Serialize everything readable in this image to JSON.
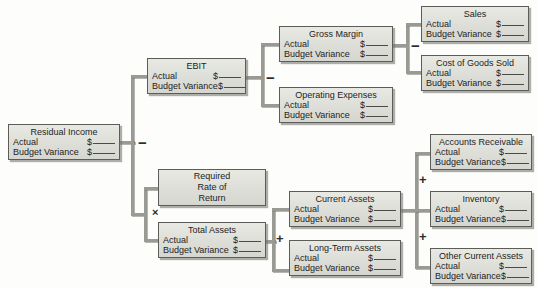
{
  "diagram": {
    "row_labels": {
      "actual": "Actual",
      "budget_variance": "Budget Variance",
      "currency": "$"
    },
    "operators": [
      {
        "name": "residual-income-minus",
        "symbol": "−"
      },
      {
        "name": "ebit-minus",
        "symbol": "−"
      },
      {
        "name": "gross-margin-minus",
        "symbol": "−"
      },
      {
        "name": "required-rate-times",
        "symbol": "×"
      },
      {
        "name": "total-assets-plus",
        "symbol": "+"
      },
      {
        "name": "current-assets-plus-top",
        "symbol": "+"
      },
      {
        "name": "current-assets-plus-bottom",
        "symbol": "+"
      }
    ],
    "nodes": {
      "residual_income": {
        "title": "Residual Income"
      },
      "ebit": {
        "title": "EBIT"
      },
      "gross_margin": {
        "title": "Gross Margin"
      },
      "operating_expenses": {
        "title": "Operating Expenses"
      },
      "sales": {
        "title": "Sales"
      },
      "cost_of_goods_sold": {
        "title": "Cost of Goods Sold"
      },
      "required_rate_of_return": {
        "line1": "Required",
        "line2": "Rate of",
        "line3": "Return"
      },
      "total_assets": {
        "title": "Total Assets"
      },
      "current_assets": {
        "title": "Current Assets"
      },
      "long_term_assets": {
        "title": "Long-Term Assets"
      },
      "accounts_receivable": {
        "title": "Accounts Receivable"
      },
      "inventory": {
        "title": "Inventory"
      },
      "other_current_assets": {
        "title": "Other Current Assets"
      }
    },
    "colors": {
      "box_fill": "#dedeD8",
      "box_border": "#5c5c58",
      "connector": "#9a9a95",
      "text": "#1d1d1d",
      "background": "#fdfdfb"
    }
  }
}
